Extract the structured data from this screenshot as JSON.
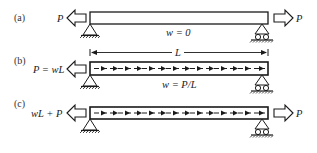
{
  "figure": {
    "panels": [
      {
        "id": "a",
        "tag": "(a)",
        "left_load_label": "P",
        "right_load_label": "P",
        "distributed_label": "w = 0",
        "has_distributed_load": false
      },
      {
        "id": "b",
        "tag": "(b)",
        "left_load_label": "P = wL",
        "right_load_label": "",
        "distributed_label": "w = P/L",
        "span_label": "L",
        "has_distributed_load": true
      },
      {
        "id": "c",
        "tag": "(c)",
        "left_load_label": "wL + P",
        "right_load_label": "P",
        "distributed_label": "",
        "has_distributed_load": true
      }
    ],
    "colors": {
      "stroke": "#1a1a1a",
      "background": "#ffffff"
    }
  }
}
